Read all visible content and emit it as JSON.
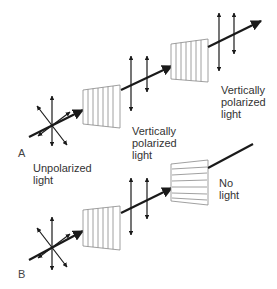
{
  "panels": {
    "a": {
      "letter": "A",
      "input_label": "Unpolarized\nlight",
      "middle_label": "Vertically\npolarized\nlight",
      "output_label": "Vertically\npolarized\nlight",
      "first_polarizer": "vertical",
      "second_polarizer": "vertical"
    },
    "b": {
      "letter": "B",
      "output_label": "No\nlight",
      "first_polarizer": "vertical",
      "second_polarizer": "horizontal"
    }
  },
  "colors": {
    "beam": "#1a1a1a",
    "polarizer_stroke": "#888888",
    "text": "#333333"
  }
}
